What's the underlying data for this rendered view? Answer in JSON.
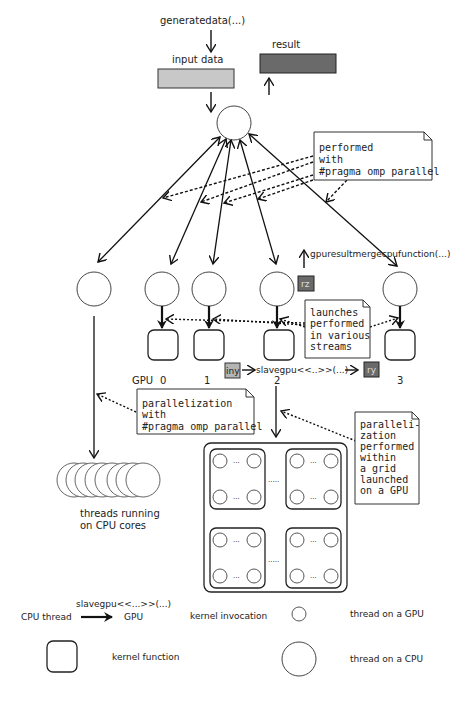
{
  "top": {
    "generate_label": "generatedata(...)",
    "input_label": "input data",
    "result_label": "result",
    "colors": {
      "input_fill": "#c8c8c8",
      "result_fill": "#6a6a6a"
    }
  },
  "notes": {
    "omp_top": [
      "performed",
      "with",
      "#pragma omp parallel"
    ],
    "streams": [
      "launches",
      "performed",
      "in various",
      "streams"
    ],
    "omp_left": [
      "parallelization",
      "with",
      "#pragma omp parallel"
    ],
    "grid": [
      "paralleli-",
      "zation",
      "performed",
      "within",
      "a grid",
      "launched",
      "on a GPU"
    ]
  },
  "gpu_row": {
    "gpu_label": "GPU",
    "indices": [
      "0",
      "1",
      "2",
      "3"
    ],
    "merge_label": "gpuresultmergecpufunction(...)",
    "rz_label": "rz",
    "iny_label": "iny",
    "ry_label": "ry",
    "kernel_call": "slavegpu<<..>>(...)",
    "colors": {
      "rz_fill": "#6a6a6a",
      "iny_fill": "#b4b4b4",
      "ry_fill": "#6a6a6a"
    }
  },
  "cpu_threads_label_1": "threads running",
  "cpu_threads_label_2": "on CPU cores",
  "grid": {
    "ellipsis_inner": "...",
    "ellipsis_outer": "....."
  },
  "legend": {
    "cpu_thread": "CPU thread",
    "gpu": "GPU",
    "kernel_call": "slavegpu<<...>>(...)",
    "kernel_invocation": "kernel invocation",
    "thread_on_gpu": "thread on a GPU",
    "kernel_function": "kernel function",
    "thread_on_cpu": "thread on a CPU"
  }
}
